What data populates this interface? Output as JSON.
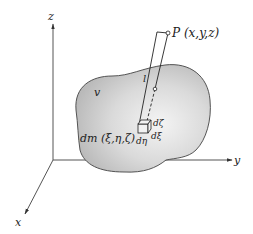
{
  "diagram": {
    "axes": {
      "x_label": "x",
      "y_label": "y",
      "z_label": "z"
    },
    "body_label": "v",
    "point_label": "P (x,y,z)",
    "distance_label": "l",
    "element_label": "dm (ξ,η,ζ)",
    "differentials": {
      "d_zeta": "dζ",
      "d_xi": "dξ",
      "d_eta": "dη"
    },
    "colors": {
      "body_fill_light": "#f2f2f2",
      "body_fill_dark": "#c4c4c4",
      "line": "#333333"
    }
  }
}
